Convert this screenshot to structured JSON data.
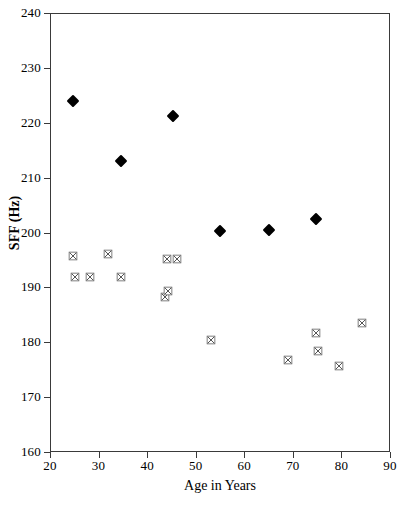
{
  "chart_data": {
    "type": "scatter",
    "title": "",
    "xlabel": "Age in Years",
    "ylabel": "SFF (Hz)",
    "xlim": [
      20,
      90
    ],
    "ylim": [
      160,
      240
    ],
    "xticks": [
      20,
      30,
      40,
      50,
      60,
      70,
      80,
      90
    ],
    "yticks": [
      160,
      170,
      180,
      190,
      200,
      210,
      220,
      230,
      240
    ],
    "grid": false,
    "legend": "none",
    "series": [
      {
        "name": "filled-diamond-series",
        "marker": "filled-diamond",
        "color": "#000000",
        "points": [
          {
            "x": 24.7,
            "y": 224.0
          },
          {
            "x": 34.6,
            "y": 213.0
          },
          {
            "x": 45.3,
            "y": 221.2
          },
          {
            "x": 55.0,
            "y": 200.3
          },
          {
            "x": 65.0,
            "y": 200.4
          },
          {
            "x": 74.8,
            "y": 202.4
          }
        ]
      },
      {
        "name": "open-square-series",
        "marker": "open-square-cross",
        "color": "#555555",
        "points": [
          {
            "x": 24.8,
            "y": 195.7
          },
          {
            "x": 25.1,
            "y": 191.9
          },
          {
            "x": 28.2,
            "y": 191.8
          },
          {
            "x": 31.9,
            "y": 196.1
          },
          {
            "x": 34.6,
            "y": 191.9
          },
          {
            "x": 43.7,
            "y": 188.2
          },
          {
            "x": 44.3,
            "y": 189.3
          },
          {
            "x": 44.1,
            "y": 195.2
          },
          {
            "x": 46.1,
            "y": 195.2
          },
          {
            "x": 53.2,
            "y": 180.4
          },
          {
            "x": 68.9,
            "y": 176.8
          },
          {
            "x": 74.7,
            "y": 181.6
          },
          {
            "x": 75.1,
            "y": 178.4
          },
          {
            "x": 79.6,
            "y": 175.6
          },
          {
            "x": 84.2,
            "y": 183.5
          }
        ]
      }
    ]
  },
  "axes": {
    "x_tick_labels": [
      "20",
      "30",
      "40",
      "50",
      "60",
      "70",
      "80",
      "90"
    ],
    "y_tick_labels": [
      "240",
      "230",
      "220",
      "210",
      "200",
      "190",
      "180",
      "170",
      "160"
    ],
    "x_axis_title": "Age in Years",
    "y_axis_title": "SFF (Hz)"
  },
  "figure": {
    "clipped_top_text": ""
  }
}
